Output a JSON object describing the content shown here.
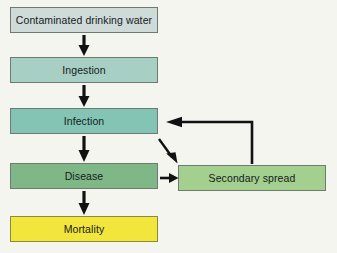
{
  "diagram": {
    "background_color": "#f4f5ef",
    "nodes": [
      {
        "id": "contaminated-water",
        "label": "Contaminated drinking water",
        "fill": "#cfdbd9",
        "border": "#6e7a72"
      },
      {
        "id": "ingestion",
        "label": "Ingestion",
        "fill": "#a8cfc4",
        "border": "#6e7a72"
      },
      {
        "id": "infection",
        "label": "Infection",
        "fill": "#84c4b4",
        "border": "#6e7a72"
      },
      {
        "id": "disease",
        "label": "Disease",
        "fill": "#7fb787",
        "border": "#6e7a72"
      },
      {
        "id": "mortality",
        "label": "Mortality",
        "fill": "#f2e53c",
        "border": "#8a8a3c"
      },
      {
        "id": "secondary-spread",
        "label": "Secondary spread",
        "fill": "#a3cf8f",
        "border": "#6e7a72"
      }
    ],
    "connectors": [
      {
        "id": "water-to-ingestion",
        "from": "contaminated-water",
        "to": "ingestion",
        "style": "down-arrow"
      },
      {
        "id": "ingestion-to-infection",
        "from": "ingestion",
        "to": "infection",
        "style": "down-arrow"
      },
      {
        "id": "infection-to-disease",
        "from": "infection",
        "to": "disease",
        "style": "down-arrow"
      },
      {
        "id": "disease-to-mortality",
        "from": "disease",
        "to": "mortality",
        "style": "down-arrow"
      },
      {
        "id": "infection-to-secondary-spread",
        "from": "infection",
        "to": "secondary-spread",
        "style": "diagonal-arrow"
      },
      {
        "id": "disease-to-secondary-spread",
        "from": "disease",
        "to": "secondary-spread",
        "style": "right-arrow"
      },
      {
        "id": "secondary-spread-to-infection",
        "from": "secondary-spread",
        "to": "infection",
        "style": "feedback-loop"
      }
    ],
    "arrow_color": "#111111"
  }
}
